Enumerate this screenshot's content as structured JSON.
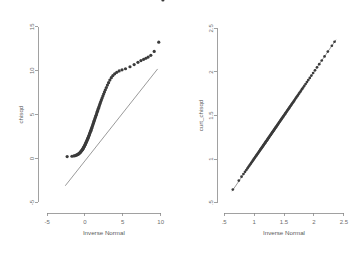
{
  "figure": {
    "background_color": "#ffffff",
    "point_color": "#3b3b3b",
    "line_color": "#6f6f6f",
    "axis_color": "#8a8a8a",
    "text_color": "#6d6d6d"
  },
  "chart_data": [
    {
      "type": "scatter",
      "panel": "left",
      "title": "",
      "xlabel": "Inverse Normal",
      "ylabel": "chisqd",
      "xlim": [
        -6.2,
        11.5
      ],
      "ylim": [
        -6.2,
        16.0
      ],
      "xticks": [
        -5,
        0,
        5,
        10
      ],
      "xticklabels": [
        "-5",
        "0",
        "5",
        "10"
      ],
      "yticks": [
        -5,
        0,
        5,
        10,
        15
      ],
      "yticklabels": [
        "-5",
        "0",
        "5",
        "10",
        "15"
      ],
      "grid": false,
      "legend": "none",
      "reference_line": {
        "label": "45-degree reference line",
        "x": [
          -2.6,
          9.6
        ],
        "y": [
          -3.1,
          10.2
        ]
      },
      "series": [
        {
          "name": "chisqd quantiles",
          "marker": "circle",
          "x": [
            -2.35,
            -1.72,
            -1.45,
            -1.28,
            -1.15,
            -1.05,
            -0.96,
            -0.88,
            -0.81,
            -0.74,
            -0.68,
            -0.62,
            -0.56,
            -0.51,
            -0.45,
            -0.4,
            -0.35,
            -0.3,
            -0.25,
            -0.2,
            -0.16,
            -0.11,
            -0.06,
            -0.02,
            0.03,
            0.07,
            0.12,
            0.16,
            0.21,
            0.25,
            0.3,
            0.34,
            0.39,
            0.43,
            0.48,
            0.52,
            0.57,
            0.61,
            0.66,
            0.7,
            0.75,
            0.8,
            0.84,
            0.89,
            0.94,
            0.99,
            1.04,
            1.09,
            1.14,
            1.19,
            1.24,
            1.3,
            1.35,
            1.41,
            1.47,
            1.53,
            1.59,
            1.65,
            1.72,
            1.79,
            1.86,
            1.93,
            2.01,
            2.09,
            2.18,
            2.27,
            2.37,
            2.47,
            2.58,
            2.7,
            2.83,
            2.97,
            3.12,
            3.29,
            3.48,
            3.69,
            3.93,
            4.2,
            4.52,
            4.9,
            5.36,
            5.95,
            6.5,
            7.0,
            7.4,
            7.75,
            8.05,
            8.35,
            8.7,
            9.15,
            9.75,
            10.3
          ],
          "y": [
            0.22,
            0.26,
            0.3,
            0.34,
            0.38,
            0.42,
            0.46,
            0.5,
            0.55,
            0.6,
            0.65,
            0.7,
            0.76,
            0.82,
            0.88,
            0.94,
            1.0,
            1.07,
            1.14,
            1.21,
            1.28,
            1.36,
            1.43,
            1.51,
            1.59,
            1.67,
            1.76,
            1.84,
            1.93,
            2.02,
            2.11,
            2.2,
            2.3,
            2.39,
            2.49,
            2.59,
            2.69,
            2.8,
            2.9,
            3.01,
            3.12,
            3.23,
            3.35,
            3.46,
            3.58,
            3.7,
            3.83,
            3.95,
            4.08,
            4.21,
            4.35,
            4.49,
            4.63,
            4.77,
            4.92,
            5.07,
            5.23,
            5.39,
            5.56,
            5.73,
            5.91,
            6.09,
            6.28,
            6.48,
            6.68,
            6.89,
            7.11,
            7.34,
            7.58,
            7.83,
            8.09,
            8.36,
            8.64,
            8.93,
            9.21,
            9.45,
            9.65,
            9.82,
            9.97,
            10.1,
            10.22,
            10.45,
            10.7,
            10.95,
            11.15,
            11.3,
            11.42,
            11.55,
            11.75,
            12.2,
            13.25
          ]
        }
      ]
    },
    {
      "type": "scatter",
      "panel": "right",
      "title": "",
      "xlabel": "Inverse Normal",
      "ylabel": "curt_chisqd",
      "xlim": [
        0.38,
        2.62
      ],
      "ylim": [
        0.38,
        2.62
      ],
      "xticks": [
        0.5,
        1,
        1.5,
        2,
        2.5
      ],
      "xticklabels": [
        ".5",
        "1",
        "1.5",
        "2",
        "2.5"
      ],
      "yticks": [
        0.5,
        1,
        1.5,
        2,
        2.5
      ],
      "yticklabels": [
        ".5",
        "1",
        "1.5",
        "2",
        "2.5"
      ],
      "grid": false,
      "legend": "none",
      "reference_line": {
        "label": "45-degree reference line",
        "x": [
          0.63,
          2.37
        ],
        "y": [
          0.63,
          2.37
        ]
      },
      "series": [
        {
          "name": "curt_chisqd quantiles",
          "marker": "circle",
          "x": [
            0.645,
            0.745,
            0.79,
            0.822,
            0.848,
            0.87,
            0.889,
            0.906,
            0.922,
            0.936,
            0.95,
            0.963,
            0.975,
            0.987,
            0.998,
            1.009,
            1.019,
            1.029,
            1.039,
            1.049,
            1.058,
            1.067,
            1.076,
            1.085,
            1.093,
            1.102,
            1.11,
            1.118,
            1.126,
            1.134,
            1.142,
            1.15,
            1.157,
            1.165,
            1.172,
            1.18,
            1.187,
            1.194,
            1.202,
            1.209,
            1.216,
            1.223,
            1.23,
            1.237,
            1.244,
            1.251,
            1.258,
            1.265,
            1.272,
            1.279,
            1.286,
            1.293,
            1.3,
            1.307,
            1.314,
            1.321,
            1.328,
            1.335,
            1.342,
            1.349,
            1.356,
            1.363,
            1.37,
            1.378,
            1.385,
            1.392,
            1.4,
            1.407,
            1.415,
            1.423,
            1.43,
            1.438,
            1.446,
            1.454,
            1.462,
            1.471,
            1.479,
            1.488,
            1.496,
            1.505,
            1.514,
            1.523,
            1.533,
            1.542,
            1.552,
            1.562,
            1.572,
            1.583,
            1.593,
            1.604,
            1.616,
            1.627,
            1.639,
            1.651,
            1.664,
            1.677,
            1.69,
            1.704,
            1.719,
            1.734,
            1.75,
            1.766,
            1.783,
            1.801,
            1.82,
            1.84,
            1.861,
            1.883,
            1.906,
            1.931,
            1.958,
            1.987,
            2.018,
            2.052,
            2.089,
            2.131,
            2.178,
            2.233,
            2.3,
            2.345
          ],
          "y": [
            0.65,
            0.752,
            0.797,
            0.828,
            0.853,
            0.874,
            0.893,
            0.91,
            0.925,
            0.94,
            0.953,
            0.966,
            0.978,
            0.99,
            1.001,
            1.012,
            1.022,
            1.032,
            1.042,
            1.051,
            1.06,
            1.069,
            1.078,
            1.087,
            1.095,
            1.104,
            1.112,
            1.12,
            1.128,
            1.136,
            1.143,
            1.151,
            1.159,
            1.166,
            1.174,
            1.181,
            1.188,
            1.196,
            1.203,
            1.21,
            1.217,
            1.224,
            1.231,
            1.238,
            1.245,
            1.252,
            1.259,
            1.266,
            1.273,
            1.28,
            1.287,
            1.294,
            1.301,
            1.308,
            1.315,
            1.322,
            1.329,
            1.336,
            1.343,
            1.35,
            1.357,
            1.364,
            1.371,
            1.379,
            1.386,
            1.393,
            1.401,
            1.408,
            1.416,
            1.424,
            1.431,
            1.439,
            1.447,
            1.455,
            1.463,
            1.472,
            1.48,
            1.489,
            1.497,
            1.506,
            1.515,
            1.524,
            1.534,
            1.543,
            1.553,
            1.563,
            1.573,
            1.584,
            1.594,
            1.605,
            1.617,
            1.628,
            1.64,
            1.652,
            1.665,
            1.678,
            1.691,
            1.705,
            1.72,
            1.735,
            1.751,
            1.767,
            1.784,
            1.802,
            1.821,
            1.841,
            1.862,
            1.884,
            1.907,
            1.932,
            1.959,
            1.988,
            2.019,
            2.053,
            2.09,
            2.132,
            2.179,
            2.234,
            2.301,
            2.347
          ]
        }
      ]
    }
  ]
}
